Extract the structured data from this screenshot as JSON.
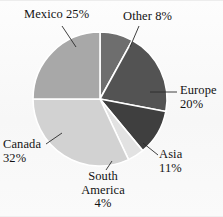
{
  "chart_data": {
    "type": "pie",
    "title": "",
    "subtitle": "",
    "xlabel": "",
    "ylabel": "",
    "legend_position": "labels-with-leader-lines",
    "grid": false,
    "units": "percent",
    "total": 100,
    "start_angle_deg": 0,
    "direction": "clockwise",
    "categories": [
      "Other",
      "Europe",
      "Asia",
      "South America",
      "Canada",
      "Mexico"
    ],
    "values": [
      8,
      20,
      11,
      4,
      32,
      25
    ],
    "slices": [
      {
        "name": "Other",
        "label_text": "Other 8%",
        "name_line": "Other 8%",
        "percent_line": "",
        "value": 8,
        "percent": "8%",
        "color": "#6e6e6e",
        "start_deg": 0,
        "end_deg": 28.8
      },
      {
        "name": "Europe",
        "label_text": "Europe 20%",
        "name_line": "Europe",
        "percent_line": "20%",
        "value": 20,
        "percent": "20%",
        "color": "#535353",
        "start_deg": 28.8,
        "end_deg": 100.8
      },
      {
        "name": "Asia",
        "label_text": "Asia 11%",
        "name_line": "Asia",
        "percent_line": "11%",
        "value": 11,
        "percent": "11%",
        "color": "#3f3f3f",
        "start_deg": 100.8,
        "end_deg": 140.4
      },
      {
        "name": "South America",
        "label_text": "South America 4%",
        "name_line_1": "South",
        "name_line_2": "America",
        "percent_line": "4%",
        "value": 4,
        "percent": "4%",
        "color": "#e2e2e2",
        "start_deg": 140.4,
        "end_deg": 154.8
      },
      {
        "name": "Canada",
        "label_text": "Canada 32%",
        "name_line": "Canada",
        "percent_line": "32%",
        "value": 32,
        "percent": "32%",
        "color": "#d2d2d2",
        "start_deg": 154.8,
        "end_deg": 270.0
      },
      {
        "name": "Mexico",
        "label_text": "Mexico 25%",
        "name_line": "Mexico 25%",
        "percent_line": "",
        "value": 25,
        "percent": "25%",
        "color": "#a8a8a8",
        "start_deg": 270.0,
        "end_deg": 360.0
      }
    ],
    "geometry": {
      "center_x": 100,
      "center_y": 99,
      "radius": 67,
      "separator_color": "#ffffff",
      "separator_width": 1.6
    },
    "background_color": "#fbfbfb",
    "text_color": "#131313"
  }
}
